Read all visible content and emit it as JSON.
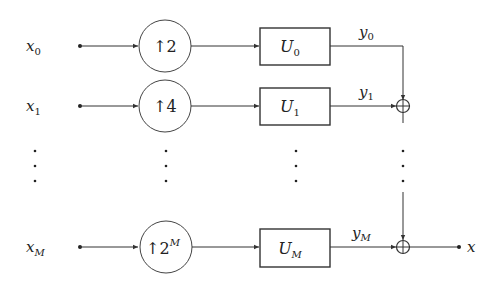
{
  "diagram": {
    "type": "block-diagram",
    "rows": [
      {
        "input": "x",
        "input_sub": "0",
        "upsampler": "↑2",
        "upsampler_sup": "",
        "filter": "U",
        "filter_sub": "0",
        "output": "y",
        "output_sub": "0"
      },
      {
        "input": "x",
        "input_sub": "1",
        "upsampler": "↑4",
        "upsampler_sup": "",
        "filter": "U",
        "filter_sub": "1",
        "output": "y",
        "output_sub": "1"
      },
      {
        "input": "x",
        "input_sub": "M",
        "upsampler": "↑2",
        "upsampler_sup": "M",
        "filter": "U",
        "filter_sub": "M",
        "output": "y",
        "output_sub": "M"
      }
    ],
    "ellipsis": "⋮",
    "sum_symbol": "⊕",
    "final_output": "x"
  },
  "colors": {
    "stroke": "#333333",
    "background": "#ffffff",
    "text": "#222222"
  }
}
